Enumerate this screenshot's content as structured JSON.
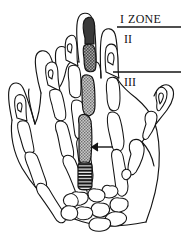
{
  "figure": {
    "background_color": "#ffffff",
    "ink_color": "#141414",
    "width": 183,
    "height": 239
  },
  "labels": {
    "zone_1_roman": "I",
    "zone_1_word": "ZONE",
    "zone_2": "II",
    "zone_3": "III"
  },
  "annotations": {
    "arrow": {
      "name": "pointer-arrow",
      "direction": "left",
      "points_to": "third metacarpal shaft"
    },
    "zone_divider_1": {
      "name": "zone-divider-line-1",
      "y": 27
    },
    "zone_divider_2": {
      "name": "zone-divider-line-2",
      "y": 72
    }
  },
  "highlight": {
    "ray": "third ray",
    "distal_phalanx_fill": "#3a3a3a",
    "middle_phalanx_fill": "#8c8c8c",
    "proximal_phalanx_fill": "#8c8c8c",
    "metacarpal_fill": "#9a9a9a",
    "metacarpal_base_fill": "#1e1e1e",
    "metacarpal_base_pattern": "horizontal-stripes"
  }
}
